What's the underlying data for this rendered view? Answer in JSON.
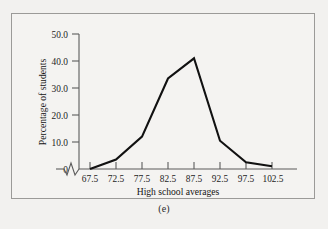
{
  "figure": {
    "caption": "(e)",
    "background_color": "#f2f1ef",
    "frame_color": "#9b9a98"
  },
  "chart_data": {
    "type": "line",
    "title": "",
    "subtitle": "",
    "xlabel": "High school averages",
    "ylabel": "Percentage of students",
    "x": [
      67.5,
      72.5,
      77.5,
      82.5,
      87.5,
      92.5,
      97.5,
      102.5
    ],
    "values": [
      0.0,
      3.5,
      12.0,
      33.5,
      41.0,
      10.5,
      2.5,
      1.0
    ],
    "series": [
      {
        "name": "Percentage of students",
        "values": [
          0.0,
          3.5,
          12.0,
          33.5,
          41.0,
          10.5,
          2.5,
          1.0
        ]
      }
    ],
    "xtick_labels": [
      "67.5",
      "72.5",
      "77.5",
      "82.5",
      "87.5",
      "92.5",
      "97.5",
      "102.5"
    ],
    "ytick_labels": [
      "0",
      "10.0",
      "20.0",
      "30.0",
      "40.0",
      "50.0"
    ],
    "ytick_values": [
      0,
      10,
      20,
      30,
      40,
      50
    ],
    "ylim": [
      0,
      50
    ],
    "xlim": [
      62.5,
      105.0
    ],
    "grid": false,
    "legend": "none",
    "line_color": "#111111",
    "axis_break": "x-axis zigzag between origin and first tick",
    "annotations": []
  }
}
